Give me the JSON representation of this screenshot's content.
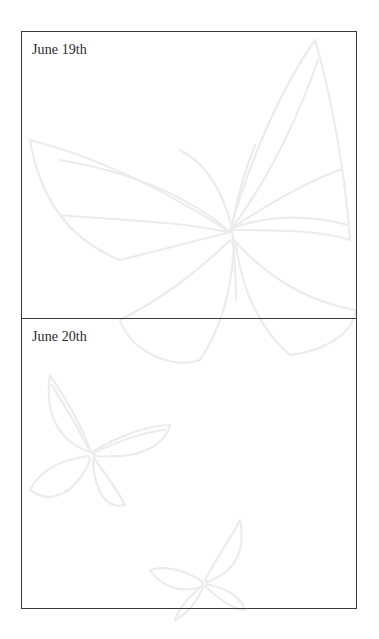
{
  "entries": [
    {
      "date": "June 19th",
      "body": ""
    },
    {
      "date": "June 20th",
      "body": ""
    }
  ],
  "colors": {
    "border": "#3a3a3a",
    "text": "#2a2a2a",
    "watermark": "#ececec",
    "background": "#ffffff"
  }
}
